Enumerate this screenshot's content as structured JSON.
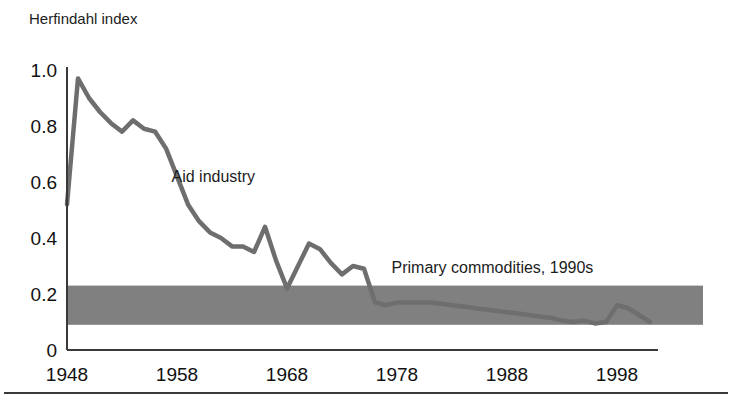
{
  "figure": {
    "background": "#ffffff",
    "ylabel_top": "Herfindahl index",
    "footer_rule_color": "#3a3a3a"
  },
  "chart_data": {
    "type": "line",
    "title": "",
    "subtitle": "",
    "xlabel": "",
    "ylabel": "Herfindahl index",
    "xlim": [
      1948,
      2002
    ],
    "ylim": [
      0,
      1.0
    ],
    "xtick_labels": [
      "1948",
      "1958",
      "1968",
      "1978",
      "1988",
      "1998"
    ],
    "xticks": [
      1948,
      1958,
      1968,
      1978,
      1988,
      1998
    ],
    "ytick_labels": [
      "0",
      "0.2",
      "0.4",
      "0.6",
      "0.8",
      "1.0"
    ],
    "yticks": [
      0,
      0.2,
      0.4,
      0.6,
      0.8,
      1.0
    ],
    "grid": false,
    "legend_position": "inline-annotations",
    "line_color": "#6e6e6e",
    "band_color": "#808080",
    "axis_color": "#3a3a3a",
    "annotations": [
      {
        "text": "Aid industry",
        "x": 1957.5,
        "y": 0.6
      },
      {
        "text": "Primary commodities, 1990s",
        "x": 1977.5,
        "y": 0.275
      }
    ],
    "bands": [
      {
        "name": "Primary commodities, 1990s",
        "y0": 0.09,
        "y1": 0.23,
        "x0": 1948,
        "x1": 2005,
        "color": "#808080"
      }
    ],
    "series": [
      {
        "name": "Aid industry",
        "color": "#6e6e6e",
        "x": [
          1948,
          1949,
          1950,
          1951,
          1952,
          1953,
          1954,
          1955,
          1956,
          1957,
          1958,
          1959,
          1960,
          1961,
          1962,
          1963,
          1964,
          1965,
          1966,
          1967,
          1968,
          1969,
          1970,
          1971,
          1972,
          1973,
          1974,
          1975,
          1976,
          1977,
          1978,
          1979,
          1980,
          1981,
          1982,
          1983,
          1984,
          1985,
          1986,
          1987,
          1988,
          1989,
          1990,
          1991,
          1992,
          1993,
          1994,
          1995,
          1996,
          1997,
          1998,
          1999,
          2000,
          2001
        ],
        "y": [
          0.52,
          0.97,
          0.9,
          0.85,
          0.81,
          0.78,
          0.82,
          0.79,
          0.78,
          0.72,
          0.62,
          0.52,
          0.46,
          0.42,
          0.4,
          0.37,
          0.37,
          0.35,
          0.44,
          0.32,
          0.22,
          0.3,
          0.38,
          0.36,
          0.31,
          0.27,
          0.3,
          0.29,
          0.17,
          0.16,
          0.17,
          0.17,
          0.17,
          0.17,
          0.165,
          0.16,
          0.155,
          0.15,
          0.145,
          0.14,
          0.135,
          0.13,
          0.125,
          0.12,
          0.115,
          0.105,
          0.1,
          0.105,
          0.095,
          0.1,
          0.16,
          0.15,
          0.125,
          0.1
        ]
      }
    ]
  }
}
